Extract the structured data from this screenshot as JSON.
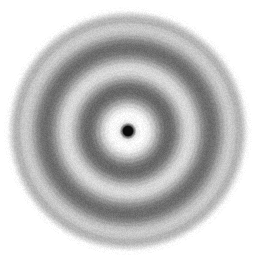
{
  "figure": {
    "width_px": 262,
    "height_px": 267,
    "background_color": "#ffffff",
    "colorspace": "grayscale",
    "noise_amplitude": 9
  },
  "chart_data": {
    "type": "heatmap",
    "subtitle": "",
    "xlabel": "",
    "ylabel": "",
    "grid": false,
    "legend": "none",
    "axis_visible": false,
    "tick_labels": [],
    "annotations": [],
    "center": {
      "x": 128,
      "y": 131
    },
    "envelope_radius_px": 122,
    "envelope_falloff_px": 14,
    "beam_stop": {
      "label": "central beam stop",
      "radius_px": 5.2,
      "color": "#0a0a0a",
      "edge_softness_px": 1.4
    },
    "radial_profile": {
      "xlabel": "radius (px)",
      "ylabel": "intensity (0 = black, 255 = white)",
      "xlim": [
        0,
        130
      ],
      "ylim": [
        0,
        255
      ],
      "r": [
        0,
        4,
        6,
        9,
        13,
        17,
        21,
        25,
        30,
        34,
        38,
        42,
        46,
        50,
        54,
        58,
        62,
        66,
        70,
        74,
        78,
        82,
        86,
        90,
        94,
        98,
        102,
        106,
        110,
        114,
        118,
        122,
        126,
        130
      ],
      "intensity": [
        12,
        14,
        120,
        236,
        250,
        248,
        236,
        206,
        160,
        124,
        106,
        104,
        118,
        150,
        186,
        212,
        218,
        208,
        178,
        144,
        118,
        108,
        112,
        132,
        164,
        192,
        204,
        198,
        176,
        150,
        130,
        124,
        140,
        190
      ]
    },
    "rings": [
      {
        "index": 0,
        "kind": "bright",
        "radius_px": 14,
        "peak_intensity": 250,
        "half_width_px": 9
      },
      {
        "index": 1,
        "kind": "dark",
        "radius_px": 40,
        "peak_intensity": 104,
        "half_width_px": 11
      },
      {
        "index": 2,
        "kind": "bright",
        "radius_px": 62,
        "peak_intensity": 218,
        "half_width_px": 10
      },
      {
        "index": 3,
        "kind": "dark",
        "radius_px": 83,
        "peak_intensity": 108,
        "half_width_px": 10
      },
      {
        "index": 4,
        "kind": "bright",
        "radius_px": 103,
        "peak_intensity": 204,
        "half_width_px": 10
      },
      {
        "index": 5,
        "kind": "dark",
        "radius_px": 122,
        "peak_intensity": 124,
        "half_width_px": 10
      }
    ],
    "palette": {
      "background": "#ffffff",
      "darkest_ring": "#5e5e5e",
      "brightest_ring": "#e8e8e8",
      "mid_gray": "#9a9a9a",
      "beam_stop": "#0a0a0a"
    }
  }
}
